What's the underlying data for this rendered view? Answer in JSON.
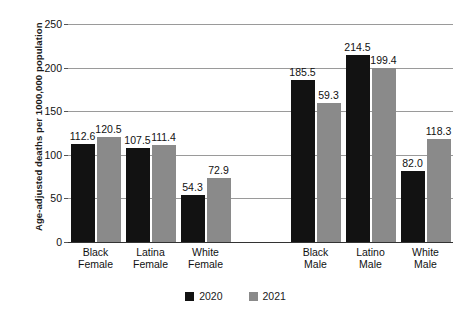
{
  "chart_data": {
    "type": "bar",
    "title": "",
    "xlabel": "",
    "ylabel": "Age-adjusted deaths per 1000,000 population",
    "ylim": [
      0,
      250
    ],
    "yticks": [
      0,
      50,
      100,
      150,
      200,
      250
    ],
    "grid": true,
    "legend_position": "bottom",
    "categories": [
      "Black Female",
      "Latina Female",
      "White Female",
      "Black Male",
      "Latino Male",
      "White Male"
    ],
    "category_lines": [
      [
        "Black",
        "Female"
      ],
      [
        "Latina",
        "Female"
      ],
      [
        "White",
        "Female"
      ],
      [
        "Black",
        "Male"
      ],
      [
        "Latino",
        "Male"
      ],
      [
        "White",
        "Male"
      ]
    ],
    "series": [
      {
        "name": "2020",
        "color": "#121212",
        "values": [
          112.6,
          107.5,
          54.3,
          185.5,
          214.5,
          82.0
        ],
        "labels": [
          "112.6",
          "107.5",
          "54.3",
          "185.5",
          "214.5",
          "82.0"
        ]
      },
      {
        "name": "2021",
        "color": "#8a8a8a",
        "values": [
          120.5,
          111.4,
          72.9,
          159.3,
          199.4,
          118.3
        ],
        "labels": [
          "120.5",
          "111.4",
          "72.9",
          "59.3",
          "199.4",
          "118.3"
        ]
      }
    ]
  },
  "legend": {
    "items": [
      {
        "label": "2020",
        "color": "#121212"
      },
      {
        "label": "2021",
        "color": "#8a8a8a"
      }
    ]
  }
}
